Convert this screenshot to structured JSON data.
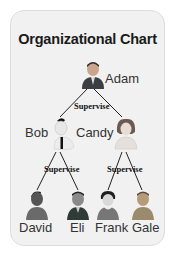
{
  "chart": {
    "title": "Organizational Chart",
    "relation_label": "Supervise",
    "nodes": {
      "adam": {
        "name": "Adam",
        "icon": "businessman-icon"
      },
      "bob": {
        "name": "Bob",
        "icon": "man-tie-icon"
      },
      "candy": {
        "name": "Candy",
        "icon": "woman-icon"
      },
      "david": {
        "name": "David",
        "icon": "man-icon"
      },
      "eli": {
        "name": "Eli",
        "icon": "man-suit-icon"
      },
      "frank": {
        "name": "Frank",
        "icon": "man-icon"
      },
      "gale": {
        "name": "Gale",
        "icon": "man-icon"
      }
    },
    "edges": [
      {
        "from": "Adam",
        "to": "Bob",
        "label": "Supervise"
      },
      {
        "from": "Adam",
        "to": "Candy",
        "label": "Supervise"
      },
      {
        "from": "Bob",
        "to": "David",
        "label": "Supervise"
      },
      {
        "from": "Bob",
        "to": "Eli",
        "label": "Supervise"
      },
      {
        "from": "Candy",
        "to": "Frank",
        "label": "Supervise"
      },
      {
        "from": "Candy",
        "to": "Gale",
        "label": "Supervise"
      }
    ]
  }
}
